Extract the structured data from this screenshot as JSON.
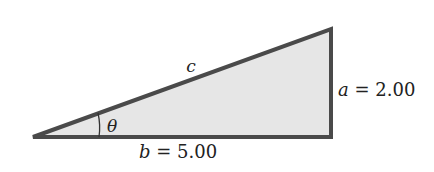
{
  "diagram": {
    "type": "right-triangle",
    "colors": {
      "stroke": "#4a4a4a",
      "fill": "#e6e6e6",
      "text": "#222222"
    },
    "labels": {
      "hypotenuse": "c",
      "angle": "θ",
      "opposite_var": "a",
      "opposite_value": "= 2.00",
      "adjacent_var": "b",
      "adjacent_value": "= 5.00"
    },
    "values": {
      "a": 2.0,
      "b": 5.0
    }
  }
}
